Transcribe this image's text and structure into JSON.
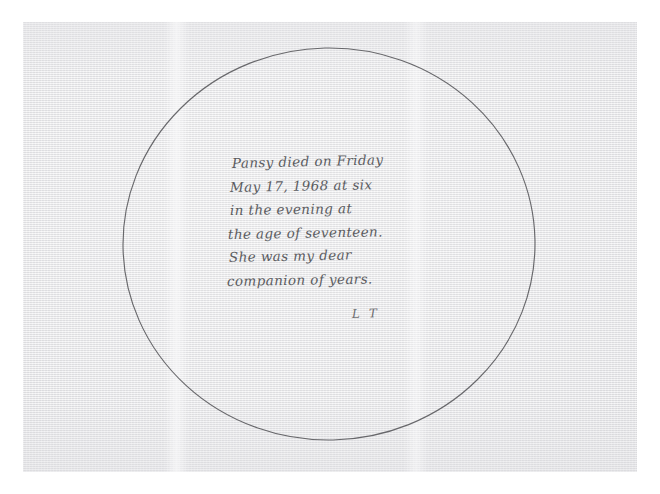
{
  "document": {
    "medium": "scanned-paper",
    "paper_color": "#ececed",
    "ink_color": "#4f5054",
    "circle_stroke_color": "#4a4a4e"
  },
  "drawing": {
    "shape_name": "hand-drawn-circle",
    "center_x": 329,
    "center_y": 244,
    "radius_x": 206,
    "radius_y": 196
  },
  "note": {
    "lines": [
      "Pansy died on Friday",
      "May 17, 1968 at six",
      "in the evening at",
      "the age of seventeen.",
      "She was my dear",
      "companion of years."
    ],
    "signature": "L T"
  }
}
